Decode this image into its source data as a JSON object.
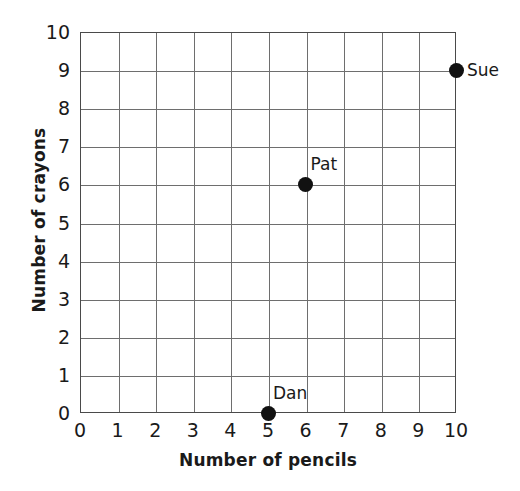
{
  "chart_data": {
    "type": "scatter",
    "title": "",
    "xlabel": "Number of pencils",
    "ylabel": "Number of crayons",
    "xlim": [
      0,
      10
    ],
    "ylim": [
      0,
      10
    ],
    "xticks": [
      "0",
      "1",
      "2",
      "3",
      "4",
      "5",
      "6",
      "7",
      "8",
      "9",
      "10"
    ],
    "yticks": [
      "0",
      "1",
      "2",
      "3",
      "4",
      "5",
      "6",
      "7",
      "8",
      "9",
      "10"
    ],
    "grid": true,
    "legend": "none",
    "points": [
      {
        "label": "Sue",
        "x": 10,
        "y": 9,
        "label_position": "right"
      },
      {
        "label": "Pat",
        "x": 6,
        "y": 6,
        "label_position": "above-right"
      },
      {
        "label": "Dan",
        "x": 5,
        "y": 0,
        "label_position": "above-right"
      }
    ]
  },
  "colors": {
    "point": "#111111",
    "gridline": "#6e6e6e",
    "axis": "#4a4a4a",
    "text": "#1a1a1a",
    "background": "#ffffff"
  }
}
